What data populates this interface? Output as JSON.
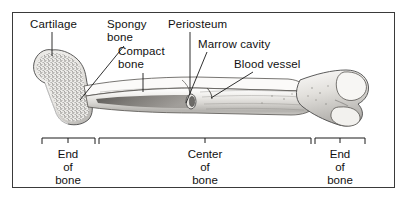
{
  "figure": {
    "frame_color": "#3a3a3a",
    "background": "#ffffff"
  },
  "callouts": [
    {
      "id": "cartilage",
      "text": "Cartilage",
      "x": 30,
      "y": 18
    },
    {
      "id": "spongy-bone",
      "text": "Spongy\nbone",
      "x": 107,
      "y": 18
    },
    {
      "id": "compact-bone",
      "text": "Compact\nbone",
      "x": 118,
      "y": 45
    },
    {
      "id": "periosteum",
      "text": "Periosteum",
      "x": 168,
      "y": 18
    },
    {
      "id": "marrow-cavity",
      "text": "Marrow cavity",
      "x": 198,
      "y": 38
    },
    {
      "id": "blood-vessel",
      "text": "Blood vessel",
      "x": 234,
      "y": 58
    }
  ],
  "regions": [
    {
      "id": "end-of-bone-left",
      "text": "End\nof\nbone",
      "center_x": 68,
      "bracket_left": 42,
      "bracket_right": 95
    },
    {
      "id": "center-of-bone",
      "text": "Center\nof\nbone",
      "center_x": 205,
      "bracket_left": 99,
      "bracket_right": 311
    },
    {
      "id": "end-of-bone-right",
      "text": "End\nof\nbone",
      "center_x": 340,
      "bracket_left": 315,
      "bracket_right": 365
    }
  ],
  "illustration": {
    "name": "femur-cutaway",
    "description": "Long bone (femur) shown lengthwise with proximal head at left, shaft at center cut away to reveal marrow cavity, and condyles at right",
    "parts": [
      "proximal epiphysis with head and greater trochanter",
      "spongy bone speckled interior",
      "compact bone outer wall",
      "periosteum outer membrane",
      "marrow cavity hollow shaft",
      "blood vessel entering shaft",
      "distal epiphysis with condyles"
    ],
    "tones": {
      "outline": "#4a4a4a",
      "bone_light": "#f2f1ef",
      "bone_mid": "#cfcdc9",
      "bone_shadow": "#9a9894",
      "cavity_dark": "#5d5b58",
      "spongy_speckle": "#6e6c69"
    }
  }
}
